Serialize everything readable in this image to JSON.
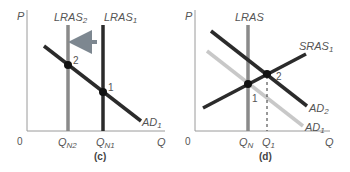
{
  "panels": [
    {
      "id": "c",
      "caption": "(c)",
      "y_axis_label": "P",
      "x_axis_label": "Q",
      "origin_label": "0",
      "curves": {
        "lras2": {
          "label": "LRAS",
          "sub": "2",
          "color": "#8a8a8a"
        },
        "lras1": {
          "label": "LRAS",
          "sub": "1",
          "color": "#2b2b2b"
        },
        "ad1": {
          "label": "AD",
          "sub": "1",
          "color": "#2b2b2b"
        }
      },
      "points": [
        {
          "label": "2"
        },
        {
          "label": "1"
        }
      ],
      "x_ticks": [
        {
          "label": "Q",
          "sub": "N2"
        },
        {
          "label": "Q",
          "sub": "N1"
        }
      ],
      "arrow": {
        "direction": "left",
        "color": "#7d8790"
      }
    },
    {
      "id": "d",
      "caption": "(d)",
      "y_axis_label": "P",
      "x_axis_label": "Q",
      "origin_label": "0",
      "curves": {
        "lras": {
          "label": "LRAS",
          "sub": "",
          "color": "#8a8a8a"
        },
        "sras1": {
          "label": "SRAS",
          "sub": "1",
          "color": "#2b2b2b"
        },
        "ad2": {
          "label": "AD",
          "sub": "2",
          "color": "#2b2b2b"
        },
        "ad1": {
          "label": "AD",
          "sub": "1",
          "color": "#c8c8c8"
        }
      },
      "points": [
        {
          "label": "1"
        },
        {
          "label": "2"
        }
      ],
      "x_ticks": [
        {
          "label": "Q",
          "sub": "N"
        },
        {
          "label": "Q",
          "sub": "1"
        }
      ]
    }
  ]
}
